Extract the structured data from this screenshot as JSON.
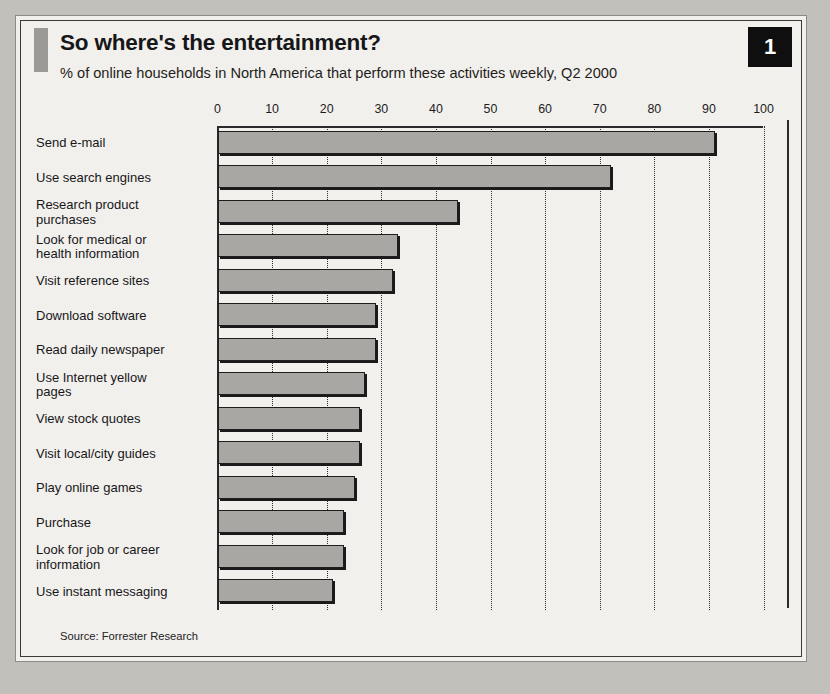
{
  "page_badge": "1",
  "header": {
    "title": "So where's the entertainment?",
    "subtitle": "% of online households in North America that perform these activities weekly, Q2 2000"
  },
  "source": "Source: Forrester Research",
  "chart_data": {
    "type": "bar",
    "orientation": "horizontal",
    "title": "So where's the entertainment?",
    "subtitle": "% of online households in North America that perform these activities weekly, Q2 2000",
    "xlabel": "",
    "ylabel": "",
    "xlim": [
      0,
      100
    ],
    "xticks": [
      0,
      10,
      20,
      30,
      40,
      50,
      60,
      70,
      80,
      90,
      100
    ],
    "tick_labels": [
      "0",
      "10",
      "20",
      "30",
      "40",
      "50",
      "60",
      "70",
      "80",
      "90",
      "100"
    ],
    "grid": "vertical-dotted",
    "legend": "none",
    "bar_color": "#a9a7a4",
    "bar_edge_color": "#1e1e1e",
    "categories": [
      "Send e-mail",
      "Use search engines",
      "Research product\npurchases",
      "Look for medical or\nhealth information",
      "Visit reference sites",
      "Download software",
      "Read daily newspaper",
      "Use Internet yellow\npages",
      "View stock quotes",
      "Visit local/city guides",
      "Play online games",
      "Purchase",
      "Look for job or career\ninformation",
      "Use instant messaging"
    ],
    "values": [
      91,
      72,
      44,
      33,
      32,
      29,
      29,
      27,
      26,
      26,
      25,
      23,
      23,
      21
    ],
    "source": "Source: Forrester Research"
  }
}
